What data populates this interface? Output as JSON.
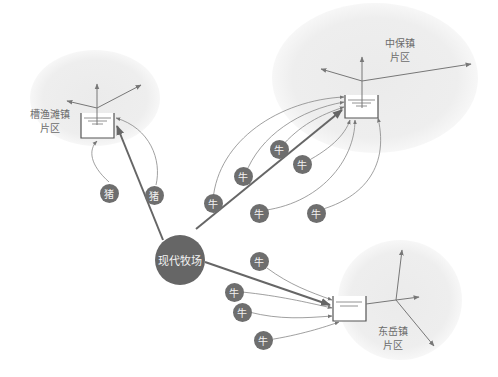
{
  "regions": [
    {
      "id": "caoyutan",
      "label_line1": "槽渔滩镇",
      "label_line2": "片区"
    },
    {
      "id": "zhongbao",
      "label_line1": "中保镇",
      "label_line2": "片区"
    },
    {
      "id": "dongyue",
      "label_line1": "东岳镇",
      "label_line2": "片区"
    }
  ],
  "hub": {
    "label": "现代牧场"
  },
  "nodes": {
    "pig": [
      {
        "label": "猪"
      },
      {
        "label": "猪"
      }
    ],
    "cattle_zhongbao": [
      {
        "label": "牛"
      },
      {
        "label": "牛"
      },
      {
        "label": "牛"
      },
      {
        "label": "牛"
      },
      {
        "label": "牛"
      },
      {
        "label": "牛"
      }
    ],
    "cattle_dongyue": [
      {
        "label": "牛"
      },
      {
        "label": "牛"
      },
      {
        "label": "牛"
      },
      {
        "label": "牛"
      }
    ]
  },
  "colors": {
    "region_fill": "#ececec",
    "node_fill": "#6e6e6e",
    "line": "#777777",
    "background": "#ffffff"
  }
}
